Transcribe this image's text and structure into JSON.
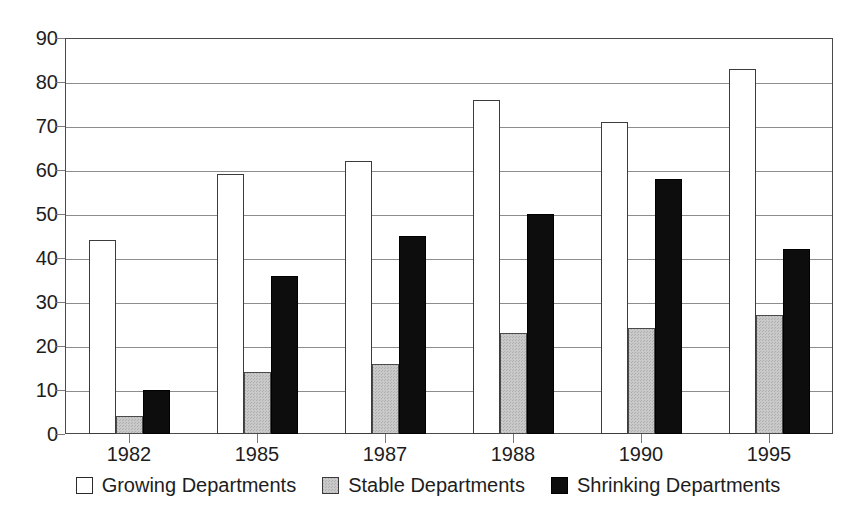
{
  "chart_data": {
    "type": "bar",
    "title": "",
    "subtitle": "",
    "xlabel": "",
    "ylabel": "",
    "categories": [
      "1982",
      "1985",
      "1987",
      "1988",
      "1990",
      "1995"
    ],
    "series": [
      {
        "name": "Growing Departments",
        "color": "#ffffff",
        "values": [
          44,
          59,
          62,
          76,
          71,
          83
        ]
      },
      {
        "name": "Stable Departments",
        "color": "#c9c9c9",
        "values": [
          4,
          14,
          16,
          23,
          24,
          27
        ]
      },
      {
        "name": "Shrinking Departments",
        "color": "#0d0d0d",
        "values": [
          10,
          36,
          45,
          50,
          58,
          42
        ]
      }
    ],
    "ylim": [
      0,
      90
    ],
    "ytick_labels": [
      "0",
      "10",
      "20",
      "30",
      "40",
      "50",
      "60",
      "70",
      "80",
      "90"
    ],
    "ytick_values": [
      0,
      10,
      20,
      30,
      40,
      50,
      60,
      70,
      80,
      90
    ],
    "grid": true,
    "grid_axis": "y",
    "legend_position": "bottom",
    "legend_entries": [
      "Growing Departments",
      "Stable Departments",
      "Shrinking Departments"
    ]
  }
}
